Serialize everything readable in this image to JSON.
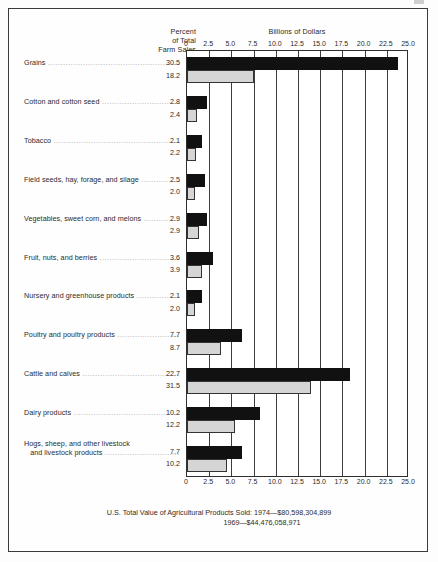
{
  "header": {
    "percent_label_line1": "Percent",
    "percent_label_line2": "of Total",
    "percent_label_line3": "Farm Sales",
    "billions_label": "Billions of Dollars"
  },
  "legend": {
    "series_1974_label": "1974",
    "series_1969_label": "1969",
    "color_1974": "#111111",
    "color_1969": "#d5d5d5"
  },
  "footer": {
    "line1": "U.S. Total Value of Agricultural Products Sold: 1974—$80,598,304,899",
    "line2": "1969—$44,476,058,971"
  },
  "chart_data": {
    "type": "bar",
    "title": "",
    "xlabel": "Billions of Dollars",
    "ylabel": "",
    "orientation": "horizontal",
    "grid": true,
    "legend_position": "inside-right-upper",
    "xlim": [
      0,
      25.0
    ],
    "xticks": [
      "0",
      "2.5",
      "5.0",
      "7.5",
      "10.0",
      "12.5",
      "15.0",
      "17.5",
      "20.0",
      "22.5",
      "25.0"
    ],
    "xtick_values": [
      0,
      2.5,
      5.0,
      7.5,
      10.0,
      12.5,
      15.0,
      17.5,
      20.0,
      22.5,
      25.0
    ],
    "categories": [
      "Grains",
      "Cotton and cotton seed",
      "Tobacco",
      "Field seeds, hay, forage, and silage",
      "Vegetables, sweet corn, and melons",
      "Fruit, nuts, and berries",
      "Nursery and greenhouse products",
      "Poultry and poultry products",
      "Cattle and calves",
      "Dairy products",
      "Hogs, sheep, and other livestock and livestock products"
    ],
    "category_lines": [
      [
        "Grains"
      ],
      [
        "Cotton and cotton seed"
      ],
      [
        "Tobacco"
      ],
      [
        "Field seeds, hay, forage, and silage"
      ],
      [
        "Vegetables, sweet corn, and melons"
      ],
      [
        "Fruit, nuts, and berries"
      ],
      [
        "Nursery and greenhouse products"
      ],
      [
        "Poultry and poultry products"
      ],
      [
        "Cattle and calves"
      ],
      [
        "Dairy products"
      ],
      [
        "Hogs, sheep, and other livestock",
        "and livestock products"
      ]
    ],
    "percent_of_total_farm_sales": {
      "1974": [
        "30.5",
        "2.8",
        "2.1",
        "2.5",
        "2.9",
        "3.6",
        "2.1",
        "7.7",
        "22.7",
        "10.2",
        "7.7"
      ],
      "1969": [
        "18.2",
        "2.4",
        "2.2",
        "2.0",
        "2.9",
        "3.9",
        "2.0",
        "8.7",
        "31.5",
        "12.2",
        "10.2"
      ]
    },
    "series": [
      {
        "name": "1974",
        "color": "#111111",
        "values": [
          23.8,
          2.3,
          1.7,
          2.0,
          2.3,
          2.9,
          1.7,
          6.2,
          18.3,
          8.2,
          6.2
        ]
      },
      {
        "name": "1969",
        "color": "#d5d5d5",
        "values": [
          7.5,
          1.1,
          1.0,
          0.9,
          1.3,
          1.7,
          0.9,
          3.8,
          14.0,
          5.4,
          4.5
        ]
      }
    ]
  }
}
